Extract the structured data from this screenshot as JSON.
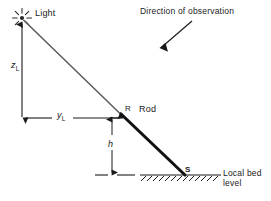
{
  "figure": {
    "width": 271,
    "height": 201,
    "background": "#ffffff",
    "line_color": "#1a1a1a",
    "ray_color": "#555555",
    "rod_color": "#111111"
  },
  "labels": {
    "light": "Light",
    "direction_of_observation": "Direction of observation",
    "rod": "Rod",
    "point_r": "R",
    "point_s": "S",
    "local_bed_level_line1": "Local bed",
    "local_bed_level_line2": "level",
    "z_symbol": "z",
    "z_subscript": "L",
    "y_symbol": "y",
    "y_subscript": "L",
    "h_symbol": "h"
  },
  "geometry": {
    "light_source": {
      "x": 22,
      "y": 18
    },
    "point_r": {
      "x": 122,
      "y": 115
    },
    "point_s": {
      "x": 184,
      "y": 175
    },
    "z_dimension": {
      "from_y": 22,
      "to_y": 117,
      "x": 22
    },
    "y_dimension": {
      "from_x": 24,
      "to_x": 120,
      "y": 118
    },
    "h_dimension": {
      "x": 112,
      "y_top": 118,
      "y_bottom": 174
    },
    "bed_level_y": 175,
    "bed_line_from_x": 140,
    "bed_line_to_x": 220,
    "dashed_line_from_x": 95,
    "dashed_line_to_x": 137,
    "observation_arrow": {
      "x1": 190,
      "y1": 22,
      "x2": 160,
      "y2": 50
    }
  },
  "icons": {
    "light_source": "sun-burst-icon",
    "observation_arrow": "arrow-down-left-icon",
    "ground_hatching": "hatch-ground-icon"
  }
}
